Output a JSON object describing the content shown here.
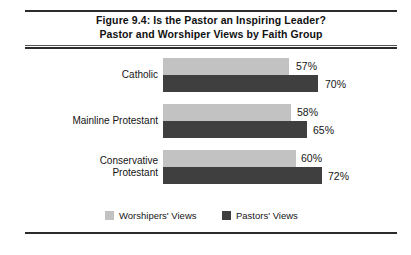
{
  "figure": {
    "title_line_1": "Figure 9.4: Is the Pastor an Inspiring Leader?",
    "title_line_2": "Pastor and Worshiper Views by Faith Group"
  },
  "legend": {
    "items": [
      {
        "label": "Worshipers' Views",
        "swatch": "light-gray-swatch",
        "color": "#c2c2c2"
      },
      {
        "label": "Pastors' Views",
        "swatch": "dark-gray-swatch",
        "color": "#3f3f3f"
      }
    ]
  },
  "groups": [
    {
      "label_line_1": "Catholic",
      "label_line_2": "",
      "worshipers_label": "57%",
      "pastors_label": "70%"
    },
    {
      "label_line_1": "Mainline Protestant",
      "label_line_2": "",
      "worshipers_label": "58%",
      "pastors_label": "65%"
    },
    {
      "label_line_1": "Conservative",
      "label_line_2": "Protestant",
      "worshipers_label": "60%",
      "pastors_label": "72%"
    }
  ],
  "chart_data": {
    "type": "bar",
    "orientation": "horizontal",
    "title": "Figure 9.4: Is the Pastor an Inspiring Leader? Pastor and Worshiper Views by Faith Group",
    "subtitle": "Pastor and Worshiper Views by Faith Group",
    "categories": [
      "Catholic",
      "Mainline Protestant",
      "Conservative Protestant"
    ],
    "series": [
      {
        "name": "Worshipers' Views",
        "values": [
          57,
          58,
          60
        ],
        "color": "#c2c2c2"
      },
      {
        "name": "Pastors' Views",
        "values": [
          70,
          65,
          72
        ],
        "color": "#3f3f3f"
      }
    ],
    "value_suffix": "%",
    "data_labels": [
      "57%",
      "70%",
      "58%",
      "65%",
      "60%",
      "72%"
    ],
    "xlabel": "",
    "ylabel": "",
    "xlim": [
      0,
      72
    ],
    "grid": false,
    "axis_visible": false,
    "legend_position": "bottom-center",
    "px_per_unit": 2.21,
    "bar_origin_x": 163
  }
}
